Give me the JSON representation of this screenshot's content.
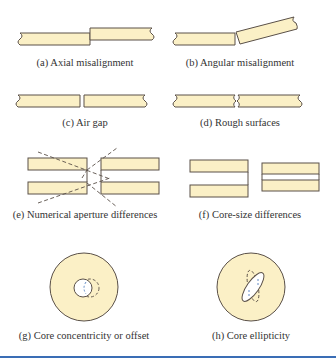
{
  "figure": {
    "colors": {
      "fiber_fill": "#fbf0c6",
      "outline": "#5a5048",
      "caption_text": "#333333",
      "rule": "#3a6db5",
      "background": "#ffffff"
    },
    "panels": [
      {
        "id": "a",
        "caption": "(a) Axial misalignment"
      },
      {
        "id": "b",
        "caption": "(b) Angular misalignment"
      },
      {
        "id": "c",
        "caption": "(c) Air gap"
      },
      {
        "id": "d",
        "caption": "(d) Rough surfaces"
      },
      {
        "id": "e",
        "caption": "(e) Numerical aperture differences"
      },
      {
        "id": "f",
        "caption": "(f) Core-size differences"
      },
      {
        "id": "g",
        "caption": "(g) Core concentricity or offset"
      },
      {
        "id": "h",
        "caption": "(h) Core ellipticity"
      }
    ]
  }
}
